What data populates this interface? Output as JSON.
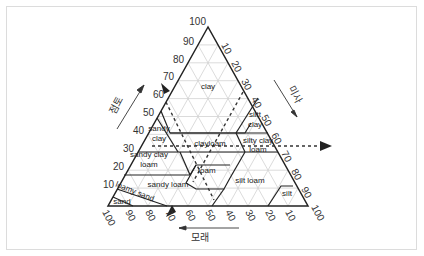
{
  "diagram": {
    "axes": {
      "clay": {
        "label": "점토",
        "ticks": [
          "10",
          "20",
          "30",
          "40",
          "50",
          "60",
          "70",
          "80",
          "90",
          "100"
        ]
      },
      "silt": {
        "label": "미사",
        "ticks": [
          "10",
          "20",
          "30",
          "40",
          "50",
          "60",
          "70",
          "80",
          "90",
          "100"
        ]
      },
      "sand": {
        "label": "모래",
        "ticks": [
          "100",
          "90",
          "80",
          "70",
          "60",
          "50",
          "40",
          "30",
          "20",
          "10"
        ]
      }
    },
    "regions": {
      "clay": "clay",
      "sandy_clay_1": "sandy",
      "sandy_clay_2": "clay",
      "silty_clay_1": "siltt",
      "silty_clay_2": "clay",
      "sandy_clay_loam_1": "sandy clay",
      "sandy_clay_loam_2": "loam",
      "clay_loam": "clayloam",
      "silty_clay_loam_1": "silty clay",
      "silty_clay_loam_2": "loam",
      "loam": "loam",
      "sandy_loam": "sandy loam",
      "silt_loam": "silt loam",
      "silt": "silt",
      "loamy_sand": "loamy sand",
      "sand": "sand"
    },
    "colors": {
      "outline": "#222222",
      "grid": "#cfcfcf",
      "dashed": "#333333",
      "card_border": "#dcdcdc"
    }
  }
}
